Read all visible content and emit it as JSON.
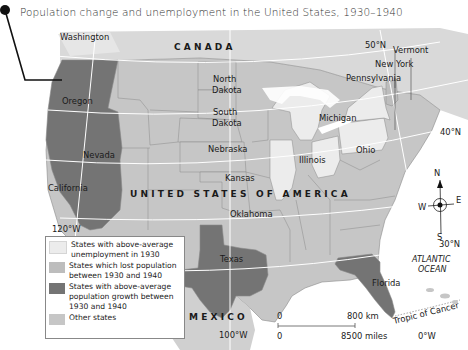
{
  "title": "Population change and unemployment in the United States, 1930–1940",
  "colors": {
    "unemployment": "#ececec",
    "lost_population": "#bdbdbd",
    "growth": "#747474",
    "other": "#c6c6c6",
    "canada_mexico": "#d9d9d9",
    "water": "#ffffff",
    "border": "#8a8a8a",
    "grid": "#ffffff"
  },
  "labels": {
    "country_canada": "CANADA",
    "country_usa": "UNITED STATES OF AMERICA",
    "country_mexico": "MEXICO",
    "ocean": [
      "ATLANTIC",
      "OCEAN"
    ],
    "states": {
      "washington": "Washington",
      "oregon": "Oregon",
      "nevada": "Nevada",
      "california": "California",
      "north_dakota": [
        "North",
        "Dakota"
      ],
      "south_dakota": [
        "South",
        "Dakota"
      ],
      "nebraska": "Nebraska",
      "kansas": "Kansas",
      "oklahoma": "Oklahoma",
      "texas": "Texas",
      "illinois": "Illinois",
      "michigan": "Michigan",
      "ohio": "Ohio",
      "pennsylvania": "Pennsylvania",
      "new_york": "New York",
      "vermont": "Vermont",
      "florida": "Florida"
    },
    "gridlines": {
      "lat_50": "50°N",
      "lat_40": "40°N",
      "lat_30": "30°N",
      "lon_120": "120°W",
      "lon_100": "100°W",
      "lon_0": "0°W",
      "tropic": "Tropic of Cancer"
    }
  },
  "compass": {
    "n": "N",
    "s": "S",
    "e": "E",
    "w": "W"
  },
  "scale": {
    "zero_top": "0",
    "km": "800 km",
    "zero_bottom": "0",
    "miles": "8500 miles"
  },
  "legend": [
    {
      "label": "States with above-average unemployment in 1930",
      "color": "#ececec"
    },
    {
      "label": "States which lost population between 1930 and 1940",
      "color": "#bdbdbd"
    },
    {
      "label": "States with above-average population growth between 1930 and 1940",
      "color": "#747474"
    },
    {
      "label": "Other states",
      "color": "#c6c6c6"
    }
  ]
}
